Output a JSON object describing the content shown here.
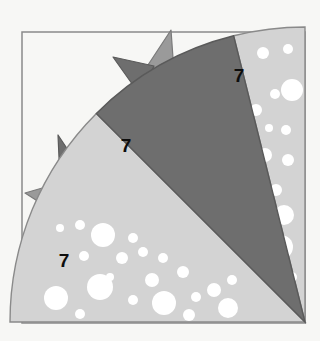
{
  "figure": {
    "title": "",
    "background_color": "#f7f7f5",
    "frame": {
      "name": "outer-frame",
      "stroke_color": "#8a8a8a",
      "fill_color": "#f7f7f5",
      "x": 22,
      "y": 32,
      "width": 283,
      "height": 291
    },
    "sector": {
      "center_x": 305,
      "center_y": 322,
      "radius": 295,
      "start_angle_deg": 180,
      "end_angle_deg": 270
    },
    "wedges": [
      {
        "id": "wedge-top-right",
        "label": "7",
        "label_x": 239,
        "label_y": 75,
        "fill_color": "#d3d3d3",
        "stroke_color": "#8a8a8a",
        "pattern": "white-dots",
        "dot_color": "#ffffff",
        "start_angle_deg": 256,
        "end_angle_deg": 270
      },
      {
        "id": "wedge-middle",
        "label": "7",
        "label_x": 126,
        "label_y": 145,
        "fill_color": "#6e6e6e",
        "stroke_color": "#5a5a5a",
        "pattern": "solid",
        "start_angle_deg": 225,
        "end_angle_deg": 256
      },
      {
        "id": "wedge-bottom-left",
        "label": "7",
        "label_x": 64,
        "label_y": 260,
        "fill_color": "#d3d3d3",
        "stroke_color": "#8a8a8a",
        "pattern": "white-dots",
        "dot_color": "#ffffff",
        "start_angle_deg": 180,
        "end_angle_deg": 225
      }
    ],
    "spikes": [
      {
        "id": "spike-1",
        "fill_color": "#9a9a9a",
        "stroke_color": "#7a7a7a",
        "points": "175,86 171,30 146,68"
      },
      {
        "id": "spike-2",
        "fill_color": "#6e6e6e",
        "stroke_color": "#5a5a5a",
        "points": "154,66 113,57 140,95"
      },
      {
        "id": "spike-3",
        "fill_color": "#6e6e6e",
        "stroke_color": "#5a5a5a",
        "points": "74,159 58,135 60,180"
      },
      {
        "id": "spike-4",
        "fill_color": "#9a9a9a",
        "stroke_color": "#7a7a7a",
        "points": "63,182 25,193 53,211"
      }
    ],
    "dots_top_right": [
      {
        "cx": 263,
        "cy": 53,
        "r": 6
      },
      {
        "cx": 288,
        "cy": 49,
        "r": 5
      },
      {
        "cx": 202,
        "cy": 85,
        "r": 14
      },
      {
        "cx": 275,
        "cy": 94,
        "r": 5
      },
      {
        "cx": 292,
        "cy": 90,
        "r": 11
      },
      {
        "cx": 230,
        "cy": 108,
        "r": 14
      },
      {
        "cx": 256,
        "cy": 110,
        "r": 6
      },
      {
        "cx": 286,
        "cy": 130,
        "r": 5
      },
      {
        "cx": 269,
        "cy": 128,
        "r": 4
      },
      {
        "cx": 239,
        "cy": 140,
        "r": 6
      },
      {
        "cx": 232,
        "cy": 162,
        "r": 15
      },
      {
        "cx": 265,
        "cy": 155,
        "r": 7
      },
      {
        "cx": 288,
        "cy": 160,
        "r": 6
      },
      {
        "cx": 248,
        "cy": 187,
        "r": 5
      },
      {
        "cx": 276,
        "cy": 190,
        "r": 6
      },
      {
        "cx": 284,
        "cy": 215,
        "r": 10
      },
      {
        "cx": 254,
        "cy": 222,
        "r": 4
      },
      {
        "cx": 281,
        "cy": 247,
        "r": 12
      },
      {
        "cx": 292,
        "cy": 277,
        "r": 5
      }
    ],
    "dots_bottom_left": [
      {
        "cx": 80,
        "cy": 225,
        "r": 5
      },
      {
        "cx": 60,
        "cy": 228,
        "r": 4
      },
      {
        "cx": 103,
        "cy": 235,
        "r": 12
      },
      {
        "cx": 133,
        "cy": 238,
        "r": 5
      },
      {
        "cx": 84,
        "cy": 256,
        "r": 5
      },
      {
        "cx": 122,
        "cy": 258,
        "r": 6
      },
      {
        "cx": 143,
        "cy": 252,
        "r": 5
      },
      {
        "cx": 163,
        "cy": 258,
        "r": 5
      },
      {
        "cx": 110,
        "cy": 277,
        "r": 4
      },
      {
        "cx": 100,
        "cy": 287,
        "r": 13
      },
      {
        "cx": 152,
        "cy": 280,
        "r": 7
      },
      {
        "cx": 183,
        "cy": 272,
        "r": 6
      },
      {
        "cx": 56,
        "cy": 298,
        "r": 12
      },
      {
        "cx": 133,
        "cy": 300,
        "r": 5
      },
      {
        "cx": 164,
        "cy": 303,
        "r": 12
      },
      {
        "cx": 196,
        "cy": 297,
        "r": 5
      },
      {
        "cx": 214,
        "cy": 290,
        "r": 7
      },
      {
        "cx": 232,
        "cy": 280,
        "r": 5
      },
      {
        "cx": 189,
        "cy": 315,
        "r": 6
      },
      {
        "cx": 228,
        "cy": 308,
        "r": 10
      },
      {
        "cx": 80,
        "cy": 314,
        "r": 5
      }
    ]
  }
}
